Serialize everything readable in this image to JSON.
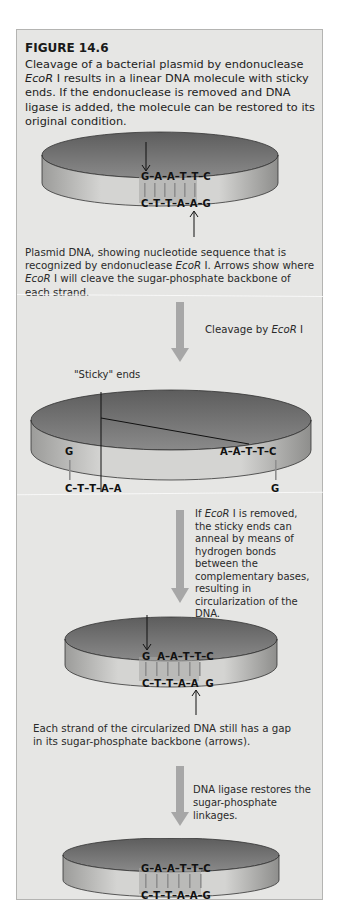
{
  "figure": {
    "title": "FIGURE 14.6",
    "caption_parts": [
      "Cleavage of a bacterial plasmid by endonuclease ",
      "EcoR",
      " I results in a linear DNA molecule with sticky ends. If the endonuclease is removed and DNA ligase is added, the molecule can be restored to its original condition."
    ]
  },
  "step1": {
    "top_strand": "G–A–A–T–T–C",
    "bottom_strand": "C–T–T–A–A–G",
    "description_parts": [
      "Plasmid DNA, showing nucleotide sequence that is recognized by endonuclease ",
      "EcoR",
      " I. Arrows show where ",
      "EcoR",
      " I will cleave the sugar-phosphate backbone of each strand."
    ]
  },
  "transition1": {
    "label_parts": [
      "Cleavage by ",
      "EcoR",
      " I"
    ]
  },
  "step2": {
    "sticky_label": "\"Sticky\" ends",
    "left_top": "G",
    "left_bottom": "C–T–T–A–A",
    "right_top": "A–A–T–T–C",
    "right_bottom": "G"
  },
  "transition2": {
    "label_parts": [
      "If ",
      "EcoR",
      " I is removed, the sticky ends can anneal by means of hydrogen bonds between the complementary bases, resulting in circularization of the DNA."
    ]
  },
  "step3": {
    "top_strand": "G  A–A–T–T–C",
    "bottom_strand": "C–T–T–A–A  G",
    "description": "Each strand of the circularized DNA still has a gap in its sugar-phosphate backbone (arrows)."
  },
  "transition3": {
    "label": "DNA ligase restores the sugar-phosphate linkages."
  },
  "step4": {
    "top_strand": "G–A–A–T–T–C",
    "bottom_strand": "C–T–T–A–A–G"
  },
  "colors": {
    "panel_bg": "#e6e6e4",
    "ring_dark": "#6e6e6e",
    "ring_light": "#c4c4c2",
    "arrow": "#a7a7a7",
    "hbond": "#9a9a9a"
  }
}
